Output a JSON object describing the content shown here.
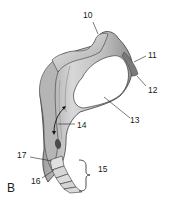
{
  "figure": {
    "panel_letter": "B",
    "labels": [
      {
        "id": "10",
        "text": "10",
        "x": 83,
        "y": 11
      },
      {
        "id": "11",
        "text": "11",
        "x": 148,
        "y": 52
      },
      {
        "id": "12",
        "text": "12",
        "x": 148,
        "y": 86
      },
      {
        "id": "13",
        "text": "13",
        "x": 130,
        "y": 114
      },
      {
        "id": "14",
        "text": "14",
        "x": 77,
        "y": 121
      },
      {
        "id": "15",
        "text": "15",
        "x": 98,
        "y": 164
      },
      {
        "id": "16",
        "text": "16",
        "x": 31,
        "y": 177
      },
      {
        "id": "17",
        "text": "17",
        "x": 17,
        "y": 151
      }
    ],
    "colors": {
      "bone_light": "#f4f4f4",
      "bone_mid": "#c8c8c8",
      "bone_dark": "#8a8a8a",
      "outline": "#3a3a3a",
      "articular_surface": "#ffffff",
      "dark_facet": "#7a7a7a"
    }
  }
}
